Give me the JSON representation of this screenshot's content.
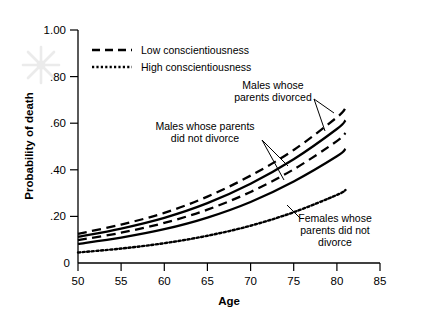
{
  "chart_data": {
    "type": "line",
    "title": "",
    "xlabel": "Age",
    "ylabel": "Probability of death",
    "xlim": [
      50,
      85
    ],
    "ylim": [
      0,
      1.0
    ],
    "grid": false,
    "xticks": [
      50,
      55,
      60,
      65,
      70,
      75,
      80,
      85
    ],
    "xtick_labels": [
      "50",
      "55",
      "60",
      "65",
      "70",
      "75",
      "80",
      "85"
    ],
    "yticks": [
      0,
      0.2,
      0.4,
      0.6,
      0.8,
      1.0
    ],
    "ytick_labels": [
      "0",
      ".20",
      ".40",
      ".60",
      ".80",
      "1.00"
    ],
    "legend": {
      "position": "upper-left-inside",
      "entries": [
        {
          "label": "Low conscientiousness",
          "style": "dashed"
        },
        {
          "label": "High conscientiousness",
          "style": "dotted"
        }
      ]
    },
    "x": [
      50,
      55,
      60,
      65,
      70,
      75,
      80,
      81
    ],
    "series": [
      {
        "name": "Males whose parents divorced, low conscientiousness",
        "style": "dashed",
        "values": [
          0.125,
          0.165,
          0.215,
          0.285,
          0.375,
          0.485,
          0.625,
          0.665
        ]
      },
      {
        "name": "Males whose parents divorced, high conscientiousness",
        "style": "solid",
        "values": [
          0.112,
          0.148,
          0.194,
          0.257,
          0.34,
          0.445,
          0.575,
          0.612
        ]
      },
      {
        "name": "Males whose parents did not divorce, low conscientiousness",
        "style": "dashed",
        "values": [
          0.098,
          0.13,
          0.172,
          0.229,
          0.305,
          0.402,
          0.523,
          0.558
        ]
      },
      {
        "name": "Males whose parents did not divorce, high conscientiousness",
        "style": "solid",
        "values": [
          0.082,
          0.109,
          0.145,
          0.195,
          0.262,
          0.35,
          0.458,
          0.49
        ]
      },
      {
        "name": "Females whose parents did not divorce, high conscientiousness",
        "style": "dotted",
        "values": [
          0.045,
          0.062,
          0.085,
          0.117,
          0.16,
          0.218,
          0.292,
          0.313
        ]
      }
    ],
    "annotations": [
      {
        "text_lines": [
          "Males whose",
          "parents divorced"
        ],
        "label": "males-parents-divorced",
        "leader_targets": 2
      },
      {
        "text_lines": [
          "Males whose parents",
          "did not divorce"
        ],
        "label": "males-parents-not-divorced",
        "leader_targets": 2
      },
      {
        "text_lines": [
          "Females whose",
          "parents did not",
          "divorce"
        ],
        "label": "females-parents-not-divorced",
        "leader_targets": 1
      }
    ]
  }
}
